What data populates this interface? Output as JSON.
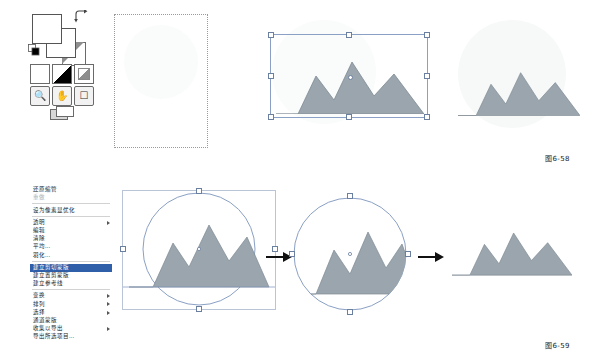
{
  "page": {
    "figure_captions": [
      {
        "id": "fig-58",
        "text": "图6-58"
      },
      {
        "id": "fig-59",
        "text": "图6-59"
      }
    ]
  },
  "tool_palette": {
    "name": "color-and-mode-palette",
    "foreground_color": "#ffffff",
    "background_color": "#ffffff",
    "swap_icon": "swap-colors-icon",
    "reset_icon": "default-colors-icon",
    "quickmask_icons": [
      "standard-mode-icon",
      "quickmask-mode-icon",
      "gradient-mode-icon"
    ],
    "bottom_icons": [
      "zoom-icon",
      "hand-icon",
      "crop-icon"
    ],
    "screen_mode_icon": "screen-mode-icon"
  },
  "context_menu": {
    "name": "layer-context-menu",
    "items": [
      {
        "label": "还原缩管",
        "state": "normal",
        "submenu": false
      },
      {
        "label": "重做",
        "state": "disabled",
        "submenu": false
      },
      {
        "label": "设为像素显优化",
        "state": "normal",
        "submenu": false
      },
      {
        "label": "透明",
        "state": "normal",
        "submenu": true
      },
      {
        "label": "编辑",
        "state": "normal",
        "submenu": false
      },
      {
        "label": "清除",
        "state": "normal",
        "submenu": false
      },
      {
        "label": "平均...",
        "state": "normal",
        "submenu": false
      },
      {
        "label": "羽化...",
        "state": "normal",
        "submenu": false
      },
      {
        "label": "建立剪切蒙版",
        "state": "selected",
        "submenu": false
      },
      {
        "label": "建立置剪蒙版",
        "state": "normal",
        "submenu": false
      },
      {
        "label": "建立参考线",
        "state": "normal",
        "submenu": false
      },
      {
        "label": "变换",
        "state": "normal",
        "submenu": true
      },
      {
        "label": "排列",
        "state": "normal",
        "submenu": true
      },
      {
        "label": "选择",
        "state": "normal",
        "submenu": true
      },
      {
        "label": "通道蒙版",
        "state": "normal",
        "submenu": false
      },
      {
        "label": "收集以导出",
        "state": "normal",
        "submenu": true
      },
      {
        "label": "导出所选项目...",
        "state": "normal",
        "submenu": false
      }
    ]
  },
  "figures": {
    "row1": {
      "name": "figure-6-58",
      "panels": [
        {
          "id": "panel-1",
          "label": "empty-selection-canvas",
          "shows_mountain": false,
          "frame": "dotted"
        },
        {
          "id": "panel-2",
          "label": "mountain-with-transform-box",
          "shows_mountain": true,
          "frame": "transform-box"
        },
        {
          "id": "panel-3",
          "label": "mountain-result",
          "shows_mountain": true,
          "frame": "none"
        }
      ]
    },
    "row2": {
      "name": "figure-6-59",
      "panels": [
        {
          "id": "panel-1",
          "label": "mountain-with-circle-selection",
          "shows_mountain": true,
          "shape": "circle-selection"
        },
        {
          "id": "panel-2",
          "label": "mountain-clipped-to-circle",
          "shows_mountain": true,
          "shape": "circle-clip"
        },
        {
          "id": "panel-3",
          "label": "mountain-final",
          "shows_mountain": true,
          "shape": "none"
        }
      ],
      "arrows": [
        "arrow-1",
        "arrow-2"
      ]
    }
  },
  "colors": {
    "mountain_fill": "#9aa5ad",
    "mountain_stroke": "#7e8a93",
    "selection_blue": "#8aa0c4",
    "menu_highlight": "#2f5fa8",
    "faint_wash": "#f4f6f7"
  }
}
